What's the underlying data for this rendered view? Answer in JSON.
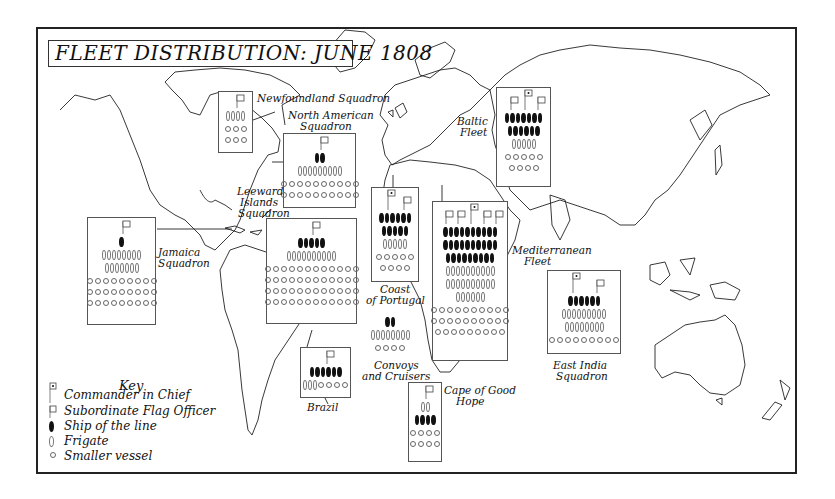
{
  "title": "FLEET DISTRIBUTION: JUNE 1808",
  "key": {
    "title": "Key",
    "items": [
      {
        "icon": "commander-flag-icon",
        "label": "Commander in Chief"
      },
      {
        "icon": "subordinate-flag-icon",
        "label": "Subordinate Flag Officer"
      },
      {
        "icon": "ship-of-line-icon",
        "label": "Ship of the line"
      },
      {
        "icon": "frigate-icon",
        "label": "Frigate"
      },
      {
        "icon": "smaller-vessel-icon",
        "label": "Smaller vessel"
      }
    ]
  },
  "colors": {
    "ink": "#111111",
    "frigate_outline": "#777777",
    "box_border": "#555555"
  },
  "squadrons": [
    {
      "id": "newfoundland",
      "label": "Newfoundland Squadron",
      "box": [
        218,
        91,
        35,
        62
      ],
      "flags": {
        "commander": 0,
        "subordinate": 1
      },
      "rows": [
        {
          "type": "frigate",
          "count": 4
        },
        {
          "type": "small",
          "count": 3
        },
        {
          "type": "small",
          "count": 3
        }
      ]
    },
    {
      "id": "north-american",
      "label": "North American Squadron",
      "box": [
        283,
        133,
        73,
        75
      ],
      "flags": {
        "commander": 0,
        "subordinate": 1
      },
      "rows": [
        {
          "type": "line",
          "count": 2
        },
        {
          "type": "frigate",
          "count": 9
        },
        {
          "type": "small",
          "count": 10
        },
        {
          "type": "small",
          "count": 10
        }
      ]
    },
    {
      "id": "leeward-islands",
      "label": "Leeward Islands Squadron",
      "box": [
        266,
        218,
        91,
        106
      ],
      "flags": {
        "commander": 0,
        "subordinate": 1
      },
      "rows": [
        {
          "type": "line",
          "count": 5
        },
        {
          "type": "frigate",
          "count": 10
        },
        {
          "type": "small",
          "count": 12
        },
        {
          "type": "small",
          "count": 12
        },
        {
          "type": "small",
          "count": 12
        },
        {
          "type": "small",
          "count": 12
        }
      ]
    },
    {
      "id": "jamaica",
      "label": "Jamaica Squadron",
      "box": [
        87,
        217,
        69,
        108
      ],
      "flags": {
        "commander": 0,
        "subordinate": 1
      },
      "rows": [
        {
          "type": "line",
          "count": 1
        },
        {
          "type": "frigate",
          "count": 8
        },
        {
          "type": "frigate",
          "count": 7
        },
        {
          "type": "small",
          "count": 9
        },
        {
          "type": "small",
          "count": 9
        },
        {
          "type": "small",
          "count": 9
        }
      ]
    },
    {
      "id": "coast-of-portugal",
      "label": "Coast of Portugal",
      "box": [
        371,
        187,
        48,
        95
      ],
      "flags": {
        "commander": 1,
        "subordinate": 1
      },
      "rows": [
        {
          "type": "line",
          "count": 6
        },
        {
          "type": "line",
          "count": 5
        },
        {
          "type": "frigate",
          "count": 5
        },
        {
          "type": "small",
          "count": 5
        },
        {
          "type": "small",
          "count": 4
        }
      ]
    },
    {
      "id": "convoys-and-cruisers",
      "label": "Convoys and Cruisers",
      "box": null,
      "flags": {
        "commander": 0,
        "subordinate": 0
      },
      "rows": [
        {
          "type": "line",
          "count": 2
        },
        {
          "type": "frigate",
          "count": 8
        },
        {
          "type": "small",
          "count": 4
        }
      ]
    },
    {
      "id": "mediterranean",
      "label": "Mediterranean Fleet",
      "box": [
        432,
        201,
        76,
        160
      ],
      "flags": {
        "commander": 1,
        "subordinate": 4
      },
      "rows": [
        {
          "type": "line",
          "count": 10
        },
        {
          "type": "line",
          "count": 10
        },
        {
          "type": "line",
          "count": 9
        },
        {
          "type": "frigate",
          "count": 10
        },
        {
          "type": "frigate",
          "count": 10
        },
        {
          "type": "frigate",
          "count": 6
        },
        {
          "type": "small",
          "count": 10
        },
        {
          "type": "small",
          "count": 10
        },
        {
          "type": "small",
          "count": 9
        }
      ]
    },
    {
      "id": "baltic",
      "label": "Baltic Fleet",
      "box": [
        496,
        87,
        55,
        100
      ],
      "flags": {
        "commander": 1,
        "subordinate": 2
      },
      "rows": [
        {
          "type": "line",
          "count": 7
        },
        {
          "type": "line",
          "count": 6
        },
        {
          "type": "frigate",
          "count": 5
        },
        {
          "type": "small",
          "count": 5
        },
        {
          "type": "small",
          "count": 4
        }
      ]
    },
    {
      "id": "east-india",
      "label": "East India Squadron",
      "box": [
        547,
        270,
        74,
        84
      ],
      "flags": {
        "commander": 1,
        "subordinate": 1
      },
      "rows": [
        {
          "type": "line",
          "count": 6
        },
        {
          "type": "frigate",
          "count": 9
        },
        {
          "type": "frigate",
          "count": 8
        },
        {
          "type": "small",
          "count": 9
        }
      ]
    },
    {
      "id": "brazil",
      "label": "Brazil",
      "box": [
        300,
        347,
        51,
        51
      ],
      "flags": {
        "commander": 0,
        "subordinate": 1
      },
      "rows": [
        {
          "type": "line",
          "count": 6
        },
        {
          "type": "mixed",
          "frigates": 3,
          "small": 4
        }
      ]
    },
    {
      "id": "cape-of-good-hope",
      "label": "Cape of Good Hope",
      "box": [
        408,
        382,
        34,
        80
      ],
      "flags": {
        "commander": 0,
        "subordinate": 1
      },
      "rows": [
        {
          "type": "frigate",
          "count": 2
        },
        {
          "type": "line",
          "count": 4
        },
        {
          "type": "small",
          "count": 4
        },
        {
          "type": "small",
          "count": 4
        }
      ]
    }
  ],
  "labels": {
    "newfoundland": "Newfoundland Squadron",
    "north_american_1": "North American",
    "north_american_2": "Squadron",
    "leeward_1": "Leeward",
    "leeward_2": "Islands",
    "leeward_3": "Squadron",
    "jamaica_1": "Jamaica",
    "jamaica_2": "Squadron",
    "portugal_1": "Coast",
    "portugal_2": "of Portugal",
    "convoys_1": "Convoys",
    "convoys_2": "and Cruisers",
    "mediterranean_1": "Mediterranean",
    "mediterranean_2": "Fleet",
    "baltic_1": "Baltic",
    "baltic_2": "Fleet",
    "east_india_1": "East India",
    "east_india_2": "Squadron",
    "brazil": "Brazil",
    "cape_1": "Cape of Good",
    "cape_2": "Hope"
  }
}
